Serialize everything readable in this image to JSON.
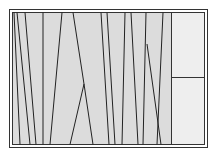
{
  "diagram": {
    "background": "#ffffff",
    "frame": {
      "outer": {
        "x": 9.5,
        "y": 9.5,
        "w": 198,
        "h": 138
      },
      "inner": {
        "x": 12.5,
        "y": 12.5,
        "w": 192,
        "h": 132
      },
      "stroke": "#333333",
      "fill": "#dcdcdc"
    },
    "right_panel": {
      "x": 171.5,
      "y": 12.5,
      "w": 33,
      "h": 132,
      "fill": "#eeeeee",
      "divider_y": 77.5,
      "stroke": "#333333"
    },
    "line_color": "#222222",
    "lines": [
      {
        "x1": 14,
        "y1": 12.5,
        "x2": 20,
        "y2": 144.5
      },
      {
        "x1": 17,
        "y1": 12.5,
        "x2": 30,
        "y2": 144.5
      },
      {
        "x1": 25,
        "y1": 12.5,
        "x2": 36,
        "y2": 144.5
      },
      {
        "x1": 43,
        "y1": 12.5,
        "x2": 43,
        "y2": 144.5
      },
      {
        "x1": 62,
        "y1": 12.5,
        "x2": 50,
        "y2": 144.5
      },
      {
        "x1": 73,
        "y1": 12.5,
        "x2": 84,
        "y2": 84
      },
      {
        "x1": 84,
        "y1": 84,
        "x2": 70,
        "y2": 144.5
      },
      {
        "x1": 84,
        "y1": 84,
        "x2": 93,
        "y2": 144.5
      },
      {
        "x1": 101,
        "y1": 12.5,
        "x2": 109,
        "y2": 144.5
      },
      {
        "x1": 107,
        "y1": 12.5,
        "x2": 115,
        "y2": 144.5
      },
      {
        "x1": 125,
        "y1": 12.5,
        "x2": 122,
        "y2": 144.5
      },
      {
        "x1": 131,
        "y1": 12.5,
        "x2": 138,
        "y2": 144.5
      },
      {
        "x1": 146,
        "y1": 12.5,
        "x2": 143,
        "y2": 144.5
      },
      {
        "x1": 147,
        "y1": 44,
        "x2": 161,
        "y2": 144.5
      },
      {
        "x1": 163,
        "y1": 12.5,
        "x2": 157,
        "y2": 144.5
      }
    ]
  }
}
